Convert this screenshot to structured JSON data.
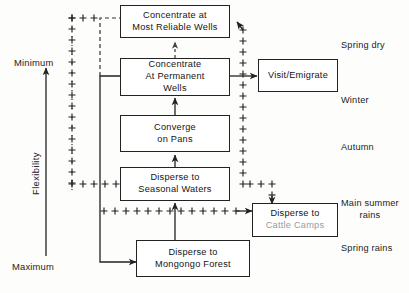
{
  "diagram": {
    "line_color": "#222222",
    "box_fill": "#ffffff"
  },
  "axis": {
    "label": "Flexibility",
    "top_cap": "Minimum",
    "bottom_cap": "Maximum",
    "arrow_direction": "up"
  },
  "nodes": [
    {
      "id": "most-reliable-wells",
      "line1": "Concentrate at",
      "line2": "Most Reliable Wells",
      "line3": ""
    },
    {
      "id": "permanent-wells",
      "line1": "Concentrate",
      "line2": "At  Permanent",
      "line3": "Wells"
    },
    {
      "id": "converge-on-pans",
      "line1": "Converge",
      "line2": "on  Pans",
      "line3": ""
    },
    {
      "id": "seasonal-waters",
      "line1": "Disperse  to",
      "line2": "Seasonal  Waters",
      "line3": ""
    },
    {
      "id": "mongongo-forest",
      "line1": "Disperse to",
      "line2": "Mongongo   Forest",
      "line3": ""
    },
    {
      "id": "visit-emigrate",
      "line1": "Visit/Emigrate",
      "line2": "",
      "line3": ""
    },
    {
      "id": "cattle-camps",
      "line1": "Disperse  to",
      "line2": "Cattle  Camps",
      "line3": ""
    }
  ],
  "seasons": [
    {
      "id": "spring-dry",
      "line1": "Spring dry",
      "line2": ""
    },
    {
      "id": "winter",
      "line1": "Winter",
      "line2": ""
    },
    {
      "id": "autumn",
      "line1": "Autumn",
      "line2": ""
    },
    {
      "id": "main-summer-rains",
      "line1": "Main  summer",
      "line2": "rains"
    },
    {
      "id": "spring-rains",
      "line1": "Spring rains",
      "line2": ""
    }
  ]
}
